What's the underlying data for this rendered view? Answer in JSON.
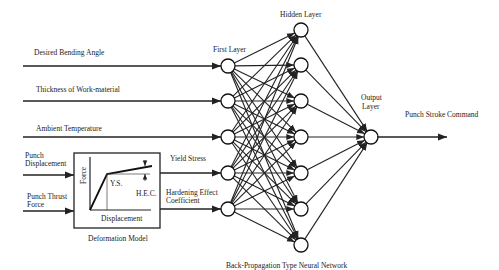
{
  "inputs": [
    {
      "label": "Desired Bending Angle",
      "y": 66
    },
    {
      "label": "Thickness of Work-material",
      "y": 101
    },
    {
      "label": "Ambient Temperature",
      "y": 137
    }
  ],
  "model_inputs": [
    {
      "line1": "Punch",
      "line2": "Displacement",
      "y": 175
    },
    {
      "line1": "Punch Thrust",
      "line2": "Force",
      "y": 211
    }
  ],
  "deformation_model": {
    "title": "Deformation Model",
    "y_axis": "Force",
    "x_axis": "Displacement",
    "ys_label": "Y.S.",
    "hec_label": "H.E.C."
  },
  "model_outputs": [
    {
      "line1": "Yield Stress",
      "line2": "",
      "y": 173
    },
    {
      "line1": "Hardening Effect",
      "line2": "Coefficient",
      "y": 209
    }
  ],
  "network": {
    "title": "Back-Propagation Type Neural Network",
    "first_layer_label": "First Layer",
    "hidden_layer_label": "Hidden Layer",
    "output_layer_label_1": "Output",
    "output_layer_label_2": "Layer",
    "first_layer_x": 228,
    "first_layer_y": [
      66,
      101,
      137,
      173,
      209
    ],
    "hidden_layer_x": 301,
    "hidden_layer_y": [
      30,
      65,
      101,
      137,
      173,
      209,
      245
    ],
    "output_x": 371,
    "output_y": 137
  },
  "output": {
    "label": "Punch Stroke Command"
  }
}
